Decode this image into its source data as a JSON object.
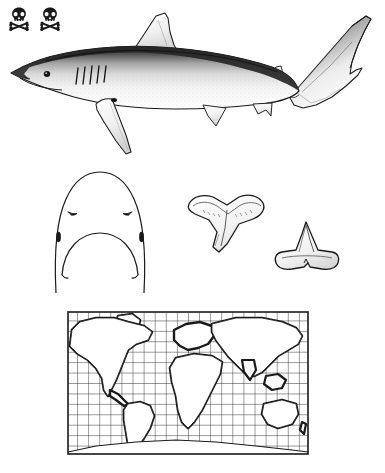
{
  "plate": {
    "kind": "field-guide-species-plate",
    "subject": "blue shark",
    "background_color": "#ffffff",
    "ink_color": "#1a1a1a"
  },
  "danger_symbols": {
    "name": "skull-and-crossbones",
    "count": 2,
    "meaning": "dangerous-to-humans rating",
    "items": [
      {
        "icon": "skull-crossbones-icon"
      },
      {
        "icon": "skull-crossbones-icon"
      }
    ]
  },
  "figures": {
    "lateral": {
      "label": "lateral-whole-body-view",
      "features": [
        "pointed snout",
        "large eye",
        "five gill slits",
        "first dorsal fin",
        "second dorsal fin",
        "long sickle-shaped pectoral fin",
        "pelvic fin",
        "anal fin",
        "heterocercal caudal fin with long upper lobe"
      ],
      "shading": "dark dorsal surface grading to pale stippled flank and white belly"
    },
    "head": {
      "label": "ventral-head-view",
      "features": [
        "rounded snout",
        "paired nostrils",
        "arched mouth",
        "labial furrows"
      ]
    },
    "tooth_upper": {
      "label": "upper-tooth",
      "features": [
        "broad triangular crown",
        "oblique cusp",
        "serrated edges"
      ]
    },
    "tooth_lower": {
      "label": "lower-tooth",
      "features": [
        "narrow upright cusp",
        "broad flat root"
      ]
    },
    "map": {
      "label": "world-distribution-map",
      "projection": "rectangular",
      "grid": {
        "columns": 22,
        "rows": 14,
        "visible": true
      },
      "range_shading": "dark coastal and shelf margins worldwide",
      "frame": true
    }
  },
  "map_geometry": {
    "grid_columns": 22,
    "grid_rows": 14,
    "landmasses": [
      "North America",
      "South America",
      "Greenland",
      "Europe",
      "Africa",
      "Asia",
      "Australia",
      "Antarctica"
    ]
  }
}
